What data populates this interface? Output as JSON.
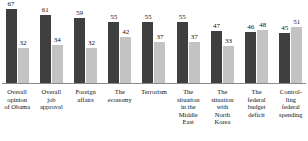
{
  "chart_data": {
    "type": "bar",
    "title": "",
    "subtitle": "",
    "xlabel": "",
    "ylabel": "",
    "ylim": [
      0,
      75
    ],
    "grid": false,
    "legend_position": "none",
    "categories": [
      "Overall opinion of Obama",
      "Overall job approval",
      "Foreign affairs",
      "The economy",
      "Terrorism",
      "The situation in the Middle East",
      "The situation with North Korea",
      "The federal budget deficit",
      "Controlling federal spending"
    ],
    "category_lines": [
      [
        "Overall",
        "opinion",
        "of Obama"
      ],
      [
        "Overall",
        "job",
        "approval"
      ],
      [
        "Foreign",
        "affairs"
      ],
      [
        "The",
        "economy"
      ],
      [
        "Terrorism"
      ],
      [
        "The",
        "situation",
        "in the",
        "Middle",
        "East"
      ],
      [
        "The",
        "situation",
        "with",
        "North",
        "Korea"
      ],
      [
        "The",
        "federal",
        "budget",
        "deficit"
      ],
      [
        "Control-",
        "ling",
        "federal",
        "spending"
      ]
    ],
    "series": [
      {
        "name": "Favorable / Approve",
        "color": "#3f3f3f",
        "values": [
          67,
          61,
          59,
          55,
          55,
          55,
          47,
          46,
          45
        ]
      },
      {
        "name": "Unfavorable / Disapprove",
        "color": "#c3c3c3",
        "values": [
          32,
          34,
          32,
          42,
          37,
          37,
          33,
          48,
          51
        ]
      }
    ]
  },
  "colors": {
    "series_a": "#3f3f3f",
    "series_b": "#c3c3c3",
    "baseline": "#8a8a8a",
    "text": "#111111",
    "background": "#ffffff"
  }
}
